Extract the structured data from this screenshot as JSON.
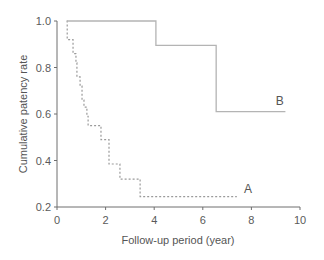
{
  "chart_data": {
    "type": "line",
    "subtype": "kaplan-meier step",
    "title": "",
    "xlabel": "Follow-up period (year)",
    "ylabel": "Cumulative patency rate",
    "xlim": [
      0,
      10
    ],
    "ylim": [
      0.2,
      1.0
    ],
    "xticks": [
      0,
      2,
      4,
      6,
      8,
      10
    ],
    "xtick_labels": [
      "0",
      "2",
      "4",
      "6",
      "8",
      "10"
    ],
    "yticks": [
      0.2,
      0.4,
      0.6,
      0.8,
      1.0
    ],
    "ytick_labels": [
      "0.2",
      "0.4",
      "0.6",
      "0.8",
      "1.0"
    ],
    "grid": false,
    "legend": "inline labels at line ends",
    "series": [
      {
        "name": "A",
        "style": "dotted",
        "color": "#9a9a9a",
        "steps": [
          [
            0.4,
            1.0
          ],
          [
            0.42,
            0.92
          ],
          [
            0.66,
            0.86
          ],
          [
            0.78,
            0.82
          ],
          [
            0.82,
            0.76
          ],
          [
            0.95,
            0.72
          ],
          [
            1.03,
            0.66
          ],
          [
            1.11,
            0.63
          ],
          [
            1.23,
            0.59
          ],
          [
            1.28,
            0.55
          ],
          [
            1.81,
            0.49
          ],
          [
            2.14,
            0.385
          ],
          [
            2.59,
            0.32
          ],
          [
            3.42,
            0.245
          ]
        ],
        "end_x": 7.4,
        "label_position": [
          7.7,
          0.26
        ]
      },
      {
        "name": "B",
        "style": "solid",
        "color": "#b4b4b4",
        "steps": [
          [
            0.4,
            1.0
          ],
          [
            4.07,
            0.895
          ],
          [
            6.55,
            0.61
          ]
        ],
        "end_x": 9.4,
        "label_position": [
          9.0,
          0.64
        ]
      }
    ]
  },
  "colors": {
    "axis": "#6e6e6e",
    "text": "#555555",
    "background": "#ffffff"
  }
}
